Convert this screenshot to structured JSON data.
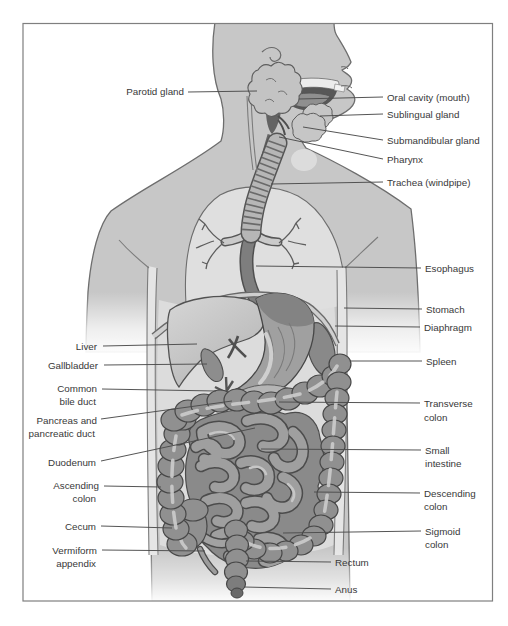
{
  "labels": {
    "parotid_gland": "Parotid gland",
    "oral_cavity": "Oral cavity (mouth)",
    "sublingual_gland": "Sublingual gland",
    "submandibular_gland": "Submandibular gland",
    "pharynx": "Pharynx",
    "trachea": "Trachea (windpipe)",
    "esophagus": "Esophagus",
    "stomach": "Stomach",
    "diaphragm": "Diaphragm",
    "spleen": "Spleen",
    "transverse_colon_1": "Transverse",
    "transverse_colon_2": "colon",
    "small_intestine_1": "Small",
    "small_intestine_2": "intestine",
    "descending_colon_1": "Descending",
    "descending_colon_2": "colon",
    "sigmoid_colon_1": "Sigmoid",
    "sigmoid_colon_2": "colon",
    "rectum": "Rectum",
    "anus": "Anus",
    "liver": "Liver",
    "gallbladder": "Gallbladder",
    "common_bile_duct_1": "Common",
    "common_bile_duct_2": "bile duct",
    "pancreas_1": "Pancreas and",
    "pancreas_2": "pancreatic duct",
    "duodenum": "Duodenum",
    "ascending_colon_1": "Ascending",
    "ascending_colon_2": "colon",
    "cecum": "Cecum",
    "vermiform_appendix_1": "Vermiform",
    "vermiform_appendix_2": "appendix"
  },
  "colors": {
    "background": "#ffffff",
    "frame_border": "#7f7f7f",
    "skin": "#c7c7c7",
    "body_cavity": "#dcdcdc",
    "organ_mid": "#9b9b9b",
    "organ_dark": "#8a8a8a",
    "outline": "#4a4a4a",
    "label_text": "#383838",
    "leader_line": "#4c4c4c"
  }
}
